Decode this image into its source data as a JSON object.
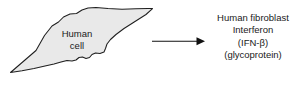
{
  "figure": {
    "background_color": "#ffffff",
    "cell": {
      "label_line1": "Human",
      "label_line2": "cell",
      "label_text": "Human\ncell",
      "fill_color": "#e9e9e9",
      "stroke_color": "#1f1f1f",
      "shape_name": "fibroblast-silhouette"
    },
    "arrow": {
      "name": "production-arrow",
      "direction": "right",
      "color": "#111111"
    },
    "product": {
      "lines": [
        "Human fibroblast",
        "Interferon",
        "(IFN-β)",
        "(glycoprotein)"
      ],
      "line1": "Human fibroblast",
      "line2": "Interferon",
      "line3": "(IFN-β)",
      "line4": "(glycoprotein)",
      "text_color": "#1a1a1a"
    }
  }
}
